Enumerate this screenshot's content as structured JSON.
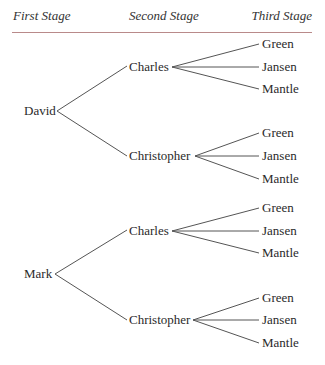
{
  "header": {
    "columns": [
      "First Stage",
      "Second Stage",
      "Third Stage"
    ],
    "rule_color": "#b98a8a"
  },
  "tree": {
    "roots": [
      {
        "label": "David",
        "children": [
          {
            "label": "Charles",
            "children": [
              "Green",
              "Jansen",
              "Mantle"
            ]
          },
          {
            "label": "Christopher",
            "children": [
              "Green",
              "Jansen",
              "Mantle"
            ]
          }
        ]
      },
      {
        "label": "Mark",
        "children": [
          {
            "label": "Charles",
            "children": [
              "Green",
              "Jansen",
              "Mantle"
            ]
          },
          {
            "label": "Christopher",
            "children": [
              "Green",
              "Jansen",
              "Mantle"
            ]
          }
        ]
      }
    ]
  },
  "line_color": "#555555"
}
